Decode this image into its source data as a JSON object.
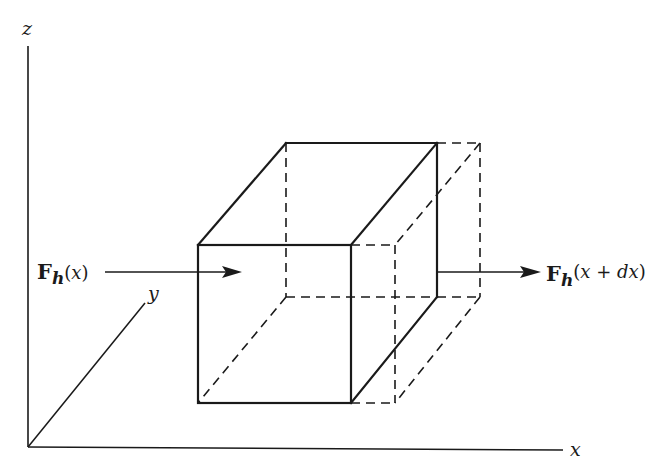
{
  "diagram": {
    "type": "3d-control-volume-heat-flux",
    "axes": {
      "z": {
        "label": "z"
      },
      "y": {
        "label": "y"
      },
      "x": {
        "label": "x"
      }
    },
    "labels": {
      "inflow": {
        "symbol": "F",
        "subscript": "h",
        "open": "(",
        "arg": "x",
        "close": ")"
      },
      "outflow": {
        "symbol": "F",
        "subscript": "h",
        "open": "(",
        "arg_a": "x",
        "plus": " + ",
        "arg_b": "dx",
        "close": ")"
      }
    },
    "colors": {
      "ink": "#1a1a1a",
      "background": "#ffffff"
    }
  }
}
